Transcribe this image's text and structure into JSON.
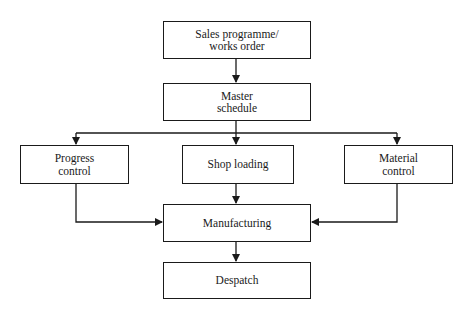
{
  "diagram": {
    "type": "flowchart",
    "nodes": {
      "sales": {
        "label": "Sales programme/\nworks order"
      },
      "master": {
        "label": "Master\nschedule"
      },
      "progress": {
        "label": "Progress\ncontrol"
      },
      "shop": {
        "label": "Shop loading"
      },
      "material": {
        "label": "Material\ncontrol"
      },
      "manufacturing": {
        "label": "Manufacturing"
      },
      "despatch": {
        "label": "Despatch"
      }
    },
    "edges": [
      {
        "from": "sales",
        "to": "master"
      },
      {
        "from": "master",
        "to": "progress"
      },
      {
        "from": "master",
        "to": "shop"
      },
      {
        "from": "master",
        "to": "material"
      },
      {
        "from": "progress",
        "to": "manufacturing"
      },
      {
        "from": "shop",
        "to": "manufacturing"
      },
      {
        "from": "material",
        "to": "manufacturing"
      },
      {
        "from": "manufacturing",
        "to": "despatch"
      }
    ],
    "colors": {
      "line": "#1a1a1a",
      "background": "#ffffff"
    }
  }
}
